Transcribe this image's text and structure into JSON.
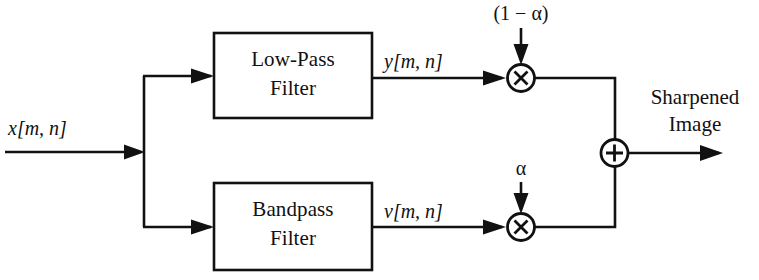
{
  "diagram": {
    "background_color": "#ffffff",
    "line_color": "#111111",
    "input": {
      "label": "x[m, n]",
      "label_italic_part": "x",
      "label_rest": "[m, n]"
    },
    "blocks": [
      {
        "id": "lowpass",
        "line1": "Low-Pass",
        "line2": "Filter",
        "output_signal": "y[m, n]"
      },
      {
        "id": "bandpass",
        "line1": "Bandpass",
        "line2": "Filter",
        "output_signal": "v[m, n]"
      }
    ],
    "signals": {
      "lowpass_out": "y[m, n]",
      "bandpass_out": "v[m, n]"
    },
    "gains": {
      "top": "(1 − α)",
      "bottom": "α"
    },
    "operators": {
      "multiply_top": "×",
      "multiply_bottom": "×",
      "sum": "+"
    },
    "output": {
      "line1": "Sharpened",
      "line2": "Image"
    }
  }
}
